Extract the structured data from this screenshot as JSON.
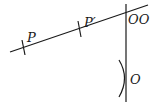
{
  "diagram": {
    "type": "geometric-construction",
    "labels": {
      "p": "P",
      "p_prime": "P′",
      "oo": "OO",
      "o": "O"
    },
    "colors": {
      "stroke": "#1a1a1a",
      "background": "#ffffff"
    }
  }
}
